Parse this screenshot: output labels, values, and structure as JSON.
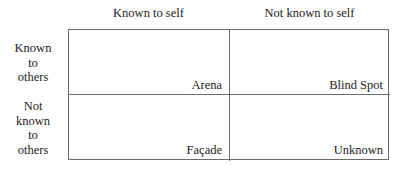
{
  "diagram": {
    "columns": [
      {
        "label": "Known to self"
      },
      {
        "label": "Not known to self"
      }
    ],
    "rows": [
      {
        "label_lines": [
          "Known",
          "to",
          "others"
        ]
      },
      {
        "label_lines": [
          "Not",
          "known",
          "to",
          "others"
        ]
      }
    ],
    "cells": [
      {
        "row": 0,
        "col": 0,
        "label": "Arena"
      },
      {
        "row": 0,
        "col": 1,
        "label": "Blind Spot"
      },
      {
        "row": 1,
        "col": 0,
        "label": "Façade"
      },
      {
        "row": 1,
        "col": 1,
        "label": "Unknown"
      }
    ],
    "colors": {
      "line": "#6a6a6a",
      "text": "#222222",
      "background": "#ffffff"
    }
  }
}
